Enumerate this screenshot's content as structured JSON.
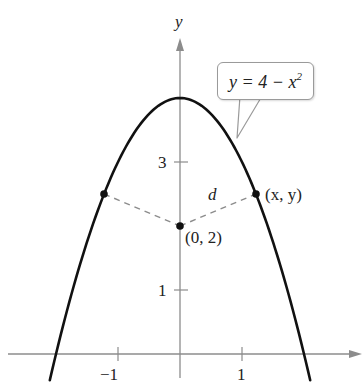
{
  "chart_data": {
    "type": "line",
    "title": "",
    "xlabel": "",
    "ylabel": "y",
    "xlim": [
      -2.9,
      2.9
    ],
    "ylim": [
      -0.35,
      5.2
    ],
    "grid": false,
    "legend": "none",
    "x_ticks": [
      -1,
      1
    ],
    "x_tick_labels": [
      "−1",
      "1"
    ],
    "y_ticks": [
      1,
      3
    ],
    "y_tick_labels": [
      "1",
      "3"
    ],
    "series": [
      {
        "name": "y = 4 − x²",
        "equation": "y = 4 - x^2",
        "x_range": [
          -2.1,
          2.1
        ],
        "color": "#111111"
      }
    ],
    "points": [
      {
        "label": "(0, 2)",
        "x": 0,
        "y": 2
      },
      {
        "label": "(x, y)",
        "x": 1.22,
        "y": 2.5
      },
      {
        "label": "",
        "x": -1.22,
        "y": 2.5
      }
    ],
    "dashed_segments": [
      {
        "from": [
          -1.22,
          2.5
        ],
        "to": [
          0,
          2
        ]
      },
      {
        "from": [
          0,
          2
        ],
        "to": [
          1.22,
          2.5
        ],
        "label": "d"
      }
    ],
    "annotations": [
      {
        "text": "y = 4 − x²",
        "type": "callout",
        "points_to": [
          0.92,
          3.15
        ]
      }
    ]
  },
  "labels": {
    "y_axis": "y",
    "tick_neg1": "−1",
    "tick_pos1": "1",
    "tick_y1": "1",
    "tick_y3": "3",
    "point_center": "(0, 2)",
    "point_xy": "(x, y)",
    "distance": "d",
    "callout_lhs": "y = 4 − x",
    "callout_exp": "2"
  },
  "colors": {
    "axis": "#8c8c8c",
    "curve": "#111111",
    "dashed": "#8c8c8c",
    "point": "#111111"
  }
}
